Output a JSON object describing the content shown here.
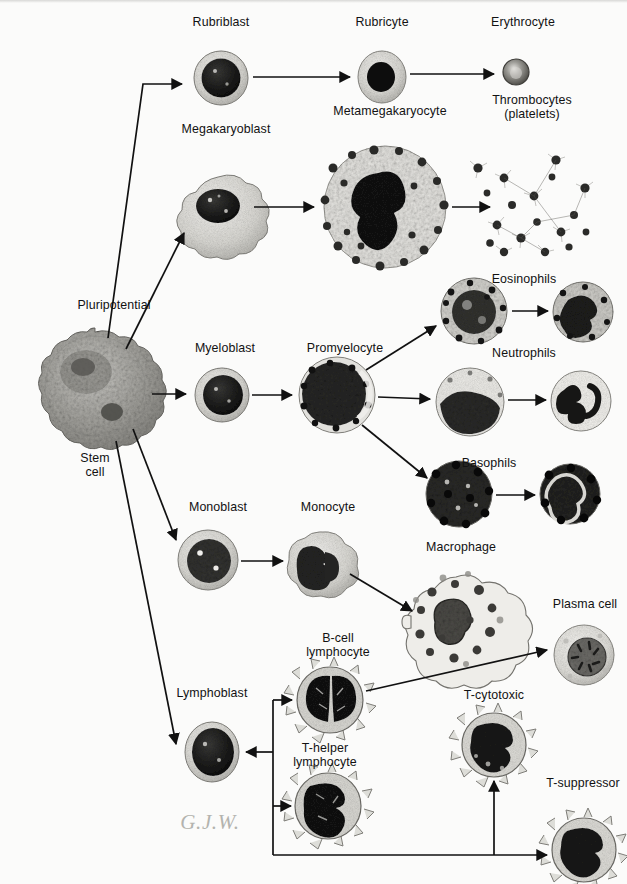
{
  "figure": {
    "signature": "G.J.W.",
    "background_color": "#fbfbfa",
    "ink_color": "#121212"
  },
  "labels": {
    "pluripotential": "Pluripotential",
    "stem_cell": "Stem\ncell",
    "rubriblast": "Rubriblast",
    "rubricyte": "Rubricyte",
    "erythrocyte": "Erythrocyte",
    "megakaryoblast": "Megakaryoblast",
    "metamegakaryocyte": "Metamegakaryocyte",
    "thrombocytes": "Thrombocytes\n(platelets)",
    "myeloblast": "Myeloblast",
    "promyelocyte": "Promyelocyte",
    "eosinophils": "Eosinophils",
    "neutrophils": "Neutrophils",
    "basophils": "Basophils",
    "monoblast": "Monoblast",
    "monocyte": "Monocyte",
    "macrophage": "Macrophage",
    "lymphoblast": "Lymphoblast",
    "b_cell_lymphocyte": "B-cell\nlymphocyte",
    "t_helper_lymphocyte": "T-helper\nlymphocyte",
    "t_cytotoxic": "T-cytotoxic",
    "t_suppressor": "T-suppressor",
    "plasma_cell": "Plasma cell"
  },
  "label_positions": {
    "pluripotential": {
      "x": 58,
      "y": 305,
      "align": "left"
    },
    "stem_cell": {
      "x": 95,
      "y": 458
    },
    "rubriblast": {
      "x": 221,
      "y": 16
    },
    "rubricyte": {
      "x": 382,
      "y": 16
    },
    "erythrocyte": {
      "x": 523,
      "y": 16
    },
    "megakaryoblast": {
      "x": 226,
      "y": 122
    },
    "metamegakaryocyte": {
      "x": 390,
      "y": 104
    },
    "thrombocytes": {
      "x": 528,
      "y": 93
    },
    "myeloblast": {
      "x": 225,
      "y": 341
    },
    "promyelocyte": {
      "x": 345,
      "y": 341
    },
    "eosinophils": {
      "x": 524,
      "y": 272
    },
    "neutrophils": {
      "x": 524,
      "y": 346
    },
    "basophils": {
      "x": 489,
      "y": 456
    },
    "monoblast": {
      "x": 218,
      "y": 500
    },
    "monocyte": {
      "x": 328,
      "y": 500
    },
    "macrophage": {
      "x": 461,
      "y": 540
    },
    "lymphoblast": {
      "x": 212,
      "y": 687
    },
    "b_cell_lymphocyte": {
      "x": 338,
      "y": 631
    },
    "t_helper_lymphocyte": {
      "x": 325,
      "y": 742
    },
    "t_cytotoxic": {
      "x": 494,
      "y": 689
    },
    "t_suppressor": {
      "x": 583,
      "y": 776
    },
    "plasma_cell": {
      "x": 585,
      "y": 597
    },
    "signature": {
      "x": 210,
      "y": 826
    }
  },
  "cells": [
    {
      "name": "stem-cell",
      "cx": 95,
      "cy": 386,
      "r": 54,
      "style": "stem"
    },
    {
      "name": "rubriblast",
      "cx": 221,
      "cy": 78,
      "r": 27,
      "style": "blast"
    },
    {
      "name": "rubricyte",
      "cx": 382,
      "cy": 77,
      "r": 24,
      "style": "rubricyte"
    },
    {
      "name": "erythrocyte",
      "cx": 516,
      "cy": 72,
      "r": 13,
      "style": "erythrocyte"
    },
    {
      "name": "megakaryoblast",
      "cx": 218,
      "cy": 207,
      "r": 30,
      "style": "megakaryoblast"
    },
    {
      "name": "metamegakaryocyte",
      "cx": 385,
      "cy": 207,
      "r": 62,
      "style": "metamega"
    },
    {
      "name": "thrombocytes",
      "cx": 520,
      "cy": 205,
      "r": 52,
      "style": "platelets"
    },
    {
      "name": "myeloblast",
      "cx": 222,
      "cy": 395,
      "r": 27,
      "style": "blast"
    },
    {
      "name": "promyelocyte",
      "cx": 337,
      "cy": 395,
      "r": 38,
      "style": "granular"
    },
    {
      "name": "eosinophil-band",
      "cx": 474,
      "cy": 311,
      "r": 33,
      "style": "granular"
    },
    {
      "name": "eosinophil-mature",
      "cx": 583,
      "cy": 312,
      "r": 30,
      "style": "granular"
    },
    {
      "name": "neutrophil-band",
      "cx": 470,
      "cy": 402,
      "r": 34,
      "style": "pale-granular"
    },
    {
      "name": "neutrophil-mature",
      "cx": 581,
      "cy": 401,
      "r": 30,
      "style": "pale-granular"
    },
    {
      "name": "basophil-band",
      "cx": 459,
      "cy": 494,
      "r": 33,
      "style": "dark-granular"
    },
    {
      "name": "basophil-mature",
      "cx": 570,
      "cy": 494,
      "r": 30,
      "style": "dark-granular"
    },
    {
      "name": "monoblast",
      "cx": 208,
      "cy": 560,
      "r": 30,
      "style": "blast"
    },
    {
      "name": "monocyte",
      "cx": 319,
      "cy": 561,
      "r": 29,
      "style": "monocyte"
    },
    {
      "name": "macrophage",
      "cx": 456,
      "cy": 623,
      "r": 47,
      "style": "macrophage"
    },
    {
      "name": "lymphoblast",
      "cx": 212,
      "cy": 752,
      "r": 29,
      "style": "blast"
    },
    {
      "name": "b-cell-lymphocyte",
      "cx": 330,
      "cy": 700,
      "r": 34,
      "style": "lymphocyte"
    },
    {
      "name": "t-helper-lymphocyte",
      "cx": 328,
      "cy": 806,
      "r": 34,
      "style": "lymphocyte"
    },
    {
      "name": "t-cytotoxic",
      "cx": 494,
      "cy": 745,
      "r": 33,
      "style": "lymphocyte"
    },
    {
      "name": "t-suppressor",
      "cx": 584,
      "cy": 850,
      "r": 33,
      "style": "lymphocyte"
    },
    {
      "name": "plasma-cell",
      "cx": 584,
      "cy": 655,
      "r": 30,
      "style": "plasma"
    }
  ],
  "arrows": [
    {
      "name": "stem-to-rubriblast",
      "path": "M 108 338 L 143 84 L 182 84"
    },
    {
      "name": "stem-to-megakaryoblast",
      "path": "M 126 349 L 184 233"
    },
    {
      "name": "stem-to-myeloblast",
      "path": "M 152 394 L 186 394"
    },
    {
      "name": "stem-to-monoblast",
      "path": "M 133 429 L 176 540"
    },
    {
      "name": "stem-to-lymphoblast",
      "path": "M 116 441 L 176 744"
    },
    {
      "name": "rubriblast-to-rubricyte",
      "path": "M 253 77 L 350 77"
    },
    {
      "name": "rubricyte-to-erythrocyte",
      "path": "M 410 74 L 494 74"
    },
    {
      "name": "megakaryoblast-to-meta",
      "path": "M 254 207 L 314 207"
    },
    {
      "name": "meta-to-thrombocytes",
      "path": "M 452 207 L 492 207"
    },
    {
      "name": "myeloblast-to-promyelocyte",
      "path": "M 252 395 L 293 395"
    },
    {
      "name": "promyelocyte-to-eosinophil",
      "path": "M 366 370 L 437 325"
    },
    {
      "name": "promyelocyte-to-neutrophil",
      "path": "M 378 397 L 430 399"
    },
    {
      "name": "promyelocyte-to-basophil",
      "path": "M 362 425 L 428 479"
    },
    {
      "name": "eosinophil-maturation",
      "path": "M 512 311 L 548 311"
    },
    {
      "name": "neutrophil-maturation",
      "path": "M 508 400 L 546 400"
    },
    {
      "name": "basophil-maturation",
      "path": "M 496 495 L 535 495"
    },
    {
      "name": "monoblast-to-monocyte",
      "path": "M 241 561 L 284 561"
    },
    {
      "name": "monocyte-to-macrophage",
      "path": "M 350 574 L 413 612"
    },
    {
      "name": "bcell-to-plasma-cell",
      "path": "M 366 691 L 548 650"
    },
    {
      "name": "lymphoblast-branch-in",
      "path": "M 273 700 L 273 855"
    },
    {
      "name": "lymphoblast-branch-arrow",
      "path": "M 273 752 L 245 752"
    },
    {
      "name": "branch-to-bcell",
      "path": "M 273 700 L 294 700"
    },
    {
      "name": "branch-to-thelper",
      "path": "M 273 806 L 292 806"
    },
    {
      "name": "branch-to-tsuppressor",
      "path": "M 273 855 L 548 855"
    },
    {
      "name": "branch-to-tcytotoxic",
      "path": "M 494 855 L 494 782"
    }
  ]
}
